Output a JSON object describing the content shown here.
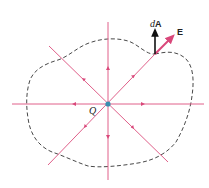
{
  "diagram": {
    "charge_label": "Q",
    "area_vector_label_prefix": "d",
    "area_vector_label_suffix": "A",
    "field_vector_label": "E",
    "colors": {
      "field_lines": "#e0608a",
      "surface": "#333333",
      "charge": "#3a8fb0",
      "area_vector": "#111111",
      "field_vector": "#d9477a"
    }
  }
}
